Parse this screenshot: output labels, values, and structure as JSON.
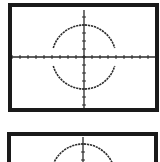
{
  "screens": [
    {
      "id": "graph-screen-1",
      "frame": {
        "x": 8,
        "y": 3,
        "w": 151,
        "h": 109
      },
      "axes": {
        "origin_x": 84,
        "origin_y": 57,
        "x_min": 12,
        "x_max": 156,
        "y_min": 10,
        "y_max": 108,
        "tick_spacing": 8,
        "tick_len": 2
      },
      "circle": {
        "cx": 84,
        "cy": 57,
        "r": 32,
        "gap_half_height": 9
      },
      "colors": {
        "frame": "#1a1a1a",
        "plot": "#2a2a2a",
        "background": "#ffffff"
      }
    },
    {
      "id": "graph-screen-2",
      "frame": {
        "x": 7,
        "y": 132,
        "w": 151,
        "h": 40
      },
      "axes": {
        "origin_x": 83,
        "origin_y": 176,
        "x_min": 11,
        "x_max": 155,
        "y_min": 137,
        "y_max": 162,
        "tick_spacing": 8,
        "tick_len": 2
      },
      "circle": {
        "cx": 83,
        "cy": 176,
        "r": 32,
        "gap_half_height": 9
      },
      "colors": {
        "frame": "#1a1a1a",
        "plot": "#2a2a2a",
        "background": "#ffffff"
      }
    }
  ]
}
